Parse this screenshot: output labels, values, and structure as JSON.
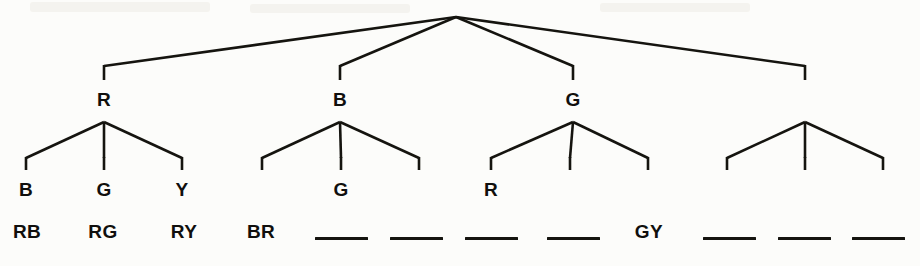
{
  "figure": {
    "kind": "syntax-tree-diagram",
    "width": 920,
    "height": 266,
    "background_color": "#fcfcfa",
    "stroke_color": "#15140f",
    "text_color": "#100f0d"
  },
  "tree": {
    "root": {
      "label": "",
      "x": 456,
      "y": 17
    },
    "level1": [
      {
        "id": "n1",
        "label": "R",
        "x": 104,
        "label_y": 90
      },
      {
        "id": "n2",
        "label": "B",
        "x": 340,
        "label_y": 90
      },
      {
        "id": "n3",
        "label": "G",
        "x": 573,
        "label_y": 90
      },
      {
        "id": "n4",
        "label": "",
        "x": 805,
        "label_y": 90
      }
    ],
    "level2": [
      {
        "parent": "n1",
        "label": "B",
        "x": 26,
        "label_y": 180
      },
      {
        "parent": "n1",
        "label": "G",
        "x": 104,
        "label_y": 180
      },
      {
        "parent": "n1",
        "label": "Y",
        "x": 182,
        "label_y": 180
      },
      {
        "parent": "n2",
        "label": "",
        "x": 262,
        "label_y": 180
      },
      {
        "parent": "n2",
        "label": "G",
        "x": 341,
        "label_y": 180
      },
      {
        "parent": "n2",
        "label": "",
        "x": 419,
        "label_y": 180
      },
      {
        "parent": "n3",
        "label": "R",
        "x": 491,
        "label_y": 180
      },
      {
        "parent": "n3",
        "label": "",
        "x": 570,
        "label_y": 180
      },
      {
        "parent": "n3",
        "label": "",
        "x": 648,
        "label_y": 180
      },
      {
        "parent": "n4",
        "label": "",
        "x": 727,
        "label_y": 180
      },
      {
        "parent": "n4",
        "label": "",
        "x": 805,
        "label_y": 180
      },
      {
        "parent": "n4",
        "label": "",
        "x": 883,
        "label_y": 180
      }
    ],
    "terminals": [
      {
        "text": "RB",
        "x": 27,
        "y": 222
      },
      {
        "text": "RG",
        "x": 103,
        "y": 222
      },
      {
        "text": "RY",
        "x": 184,
        "y": 222
      },
      {
        "text": "BR",
        "x": 261,
        "y": 222
      },
      {
        "text": "GY",
        "x": 649,
        "y": 222
      }
    ],
    "blank_terminals": [
      {
        "x": 315,
        "width": 53,
        "y": 237
      },
      {
        "x": 390,
        "width": 53,
        "y": 237
      },
      {
        "x": 465,
        "width": 53,
        "y": 237
      },
      {
        "x": 547,
        "width": 53,
        "y": 237
      },
      {
        "x": 703,
        "width": 53,
        "y": 237
      },
      {
        "x": 778,
        "width": 53,
        "y": 237
      },
      {
        "x": 852,
        "width": 53,
        "y": 237
      }
    ]
  },
  "geometry": {
    "root_branch_end_y": 66,
    "root_stub_bottom_y": 80,
    "fan_apex_y": 122,
    "fan_leg_end_y": 158,
    "leaf_stub_bottom_y": 170
  }
}
